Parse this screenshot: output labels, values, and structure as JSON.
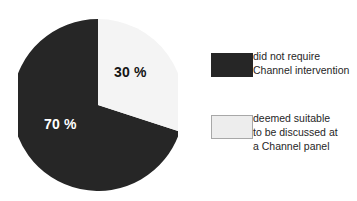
{
  "chart_data": {
    "type": "pie",
    "title": "",
    "subtitle": "",
    "xlabel": "",
    "ylabel": "",
    "grid": false,
    "legend_position": "right",
    "start_angle_deg": 0,
    "direction": "clockwise",
    "categories": [
      "did not require Channel intervention",
      "deemed suitable to be discussed at a Channel panel"
    ],
    "values": [
      70,
      30
    ],
    "value_labels": [
      "70 %",
      "30 %"
    ],
    "colors": [
      "#262626",
      "#ededed"
    ],
    "slices": [
      {
        "name": "did not require Channel intervention",
        "value": 70,
        "label": "70 %",
        "color": "#262626",
        "label_color": "#ffffff"
      },
      {
        "name": "deemed suitable to be discussed at a Channel panel",
        "value": 30,
        "label": "30 %",
        "color": "#ededed",
        "label_color": "#151515"
      }
    ]
  },
  "pie": {
    "white_slice_label": "30 %",
    "dark_slice_label": "70 %"
  },
  "legend": {
    "items": [
      {
        "swatch": "dark-swatch",
        "color": "#262626",
        "line1": "did not require",
        "line2": "Channel intervention",
        "line3": ""
      },
      {
        "swatch": "light-swatch",
        "color": "#ededed",
        "line1": "deemed suitable",
        "line2": "to be discussed at",
        "line3": "a Channel panel"
      }
    ]
  },
  "colors": {
    "background": "#ffffff",
    "dark": "#262626",
    "light": "#ededed",
    "swatch_border": "#a8a8a8",
    "text": "#262626"
  }
}
